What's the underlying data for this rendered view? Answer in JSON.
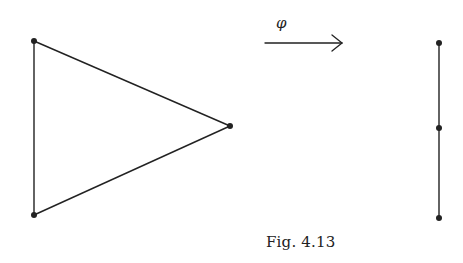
{
  "figure": {
    "caption": "Fig. 4.13",
    "map_label": "φ",
    "source_graph": {
      "shape": "triangle",
      "vertices": [
        {
          "id": "a",
          "x": 34,
          "y": 41
        },
        {
          "id": "b",
          "x": 34,
          "y": 215
        },
        {
          "id": "c",
          "x": 230,
          "y": 126
        }
      ],
      "edges": [
        [
          "a",
          "b"
        ],
        [
          "a",
          "c"
        ],
        [
          "b",
          "c"
        ]
      ]
    },
    "target_graph": {
      "shape": "path",
      "vertices": [
        {
          "id": "p",
          "x": 439,
          "y": 43
        },
        {
          "id": "q",
          "x": 439,
          "y": 128
        },
        {
          "id": "r",
          "x": 439,
          "y": 218
        }
      ],
      "edges": [
        [
          "p",
          "q"
        ],
        [
          "q",
          "r"
        ]
      ]
    },
    "colors": {
      "ink": "#222222",
      "background": "#ffffff"
    }
  }
}
